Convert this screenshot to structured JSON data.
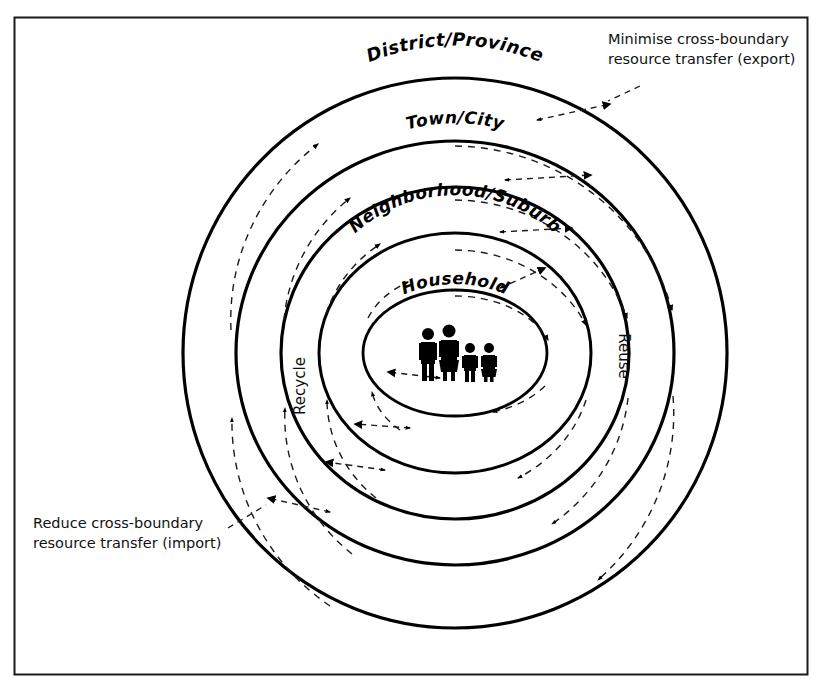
{
  "figure": {
    "kind": "concentric-rings-diagram",
    "frame_color": "#000000",
    "background": "#ffffff",
    "ink_color": "#000000"
  },
  "rings": [
    {
      "id": "national-regional",
      "label": "National/Regional",
      "level": 5,
      "rx": 272,
      "ry": 275,
      "label_font_size": 20
    },
    {
      "id": "district-province",
      "label": "District/Province",
      "level": 4,
      "rx": 219,
      "ry": 212,
      "label_font_size": 18
    },
    {
      "id": "town-city",
      "label": "Town/City",
      "level": 3,
      "rx": 174,
      "ry": 166,
      "label_font_size": 17
    },
    {
      "id": "neighborhood-suburb",
      "label": "Neighborhood/Suburb",
      "level": 2,
      "rx": 136,
      "ry": 120,
      "label_font_size": 17
    },
    {
      "id": "household",
      "label": "Household",
      "level": 1,
      "rx": 92,
      "ry": 63,
      "label_font_size": 17
    }
  ],
  "center_icon": {
    "name": "family-icon",
    "description": "Household family group: adult male, adult female, two children",
    "figure_count": 4
  },
  "flow_labels": {
    "left": "Recycle",
    "right": "Reuse"
  },
  "annotations": [
    {
      "id": "export-note",
      "line1": "Minimise cross-boundary",
      "line2": "resource transfer (export)",
      "direction": "outward",
      "position": "top-right"
    },
    {
      "id": "import-note",
      "line1": "Reduce cross-boundary",
      "line2": "resource transfer (import)",
      "direction": "inward",
      "position": "bottom-left"
    }
  ],
  "legend_notes": {
    "outward_flow": "Reuse",
    "inward_flow": "Recycle"
  }
}
